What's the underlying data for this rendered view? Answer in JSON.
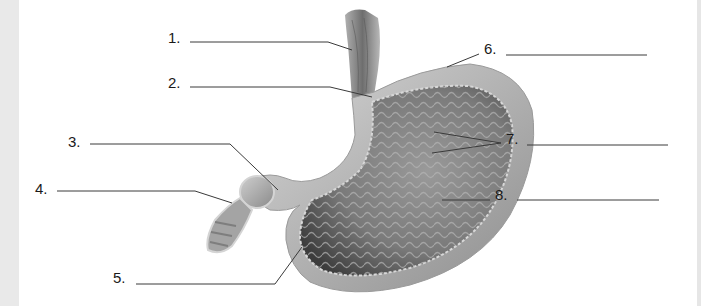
{
  "diagram": {
    "colors": {
      "background": "#ffffff",
      "side_strip": "#e9e9e9",
      "leader_line": "#3a3a3a",
      "tissue_dark": "#4a4a4a",
      "tissue_mid": "#8c8c8c",
      "tissue_light": "#c8c8c8"
    },
    "labels": [
      {
        "number": "1.",
        "answer": "",
        "x": 168,
        "y": 30
      },
      {
        "number": "2.",
        "answer": "",
        "x": 168,
        "y": 75
      },
      {
        "number": "3.",
        "answer": "",
        "x": 68,
        "y": 134
      },
      {
        "number": "4.",
        "answer": "",
        "x": 35,
        "y": 181
      },
      {
        "number": "5.",
        "answer": "",
        "x": 113,
        "y": 270
      },
      {
        "number": "6.",
        "answer": "",
        "x": 484,
        "y": 41
      },
      {
        "number": "7.",
        "answer": "",
        "x": 506,
        "y": 131
      },
      {
        "number": "8.",
        "answer": "",
        "x": 495,
        "y": 187
      }
    ]
  }
}
